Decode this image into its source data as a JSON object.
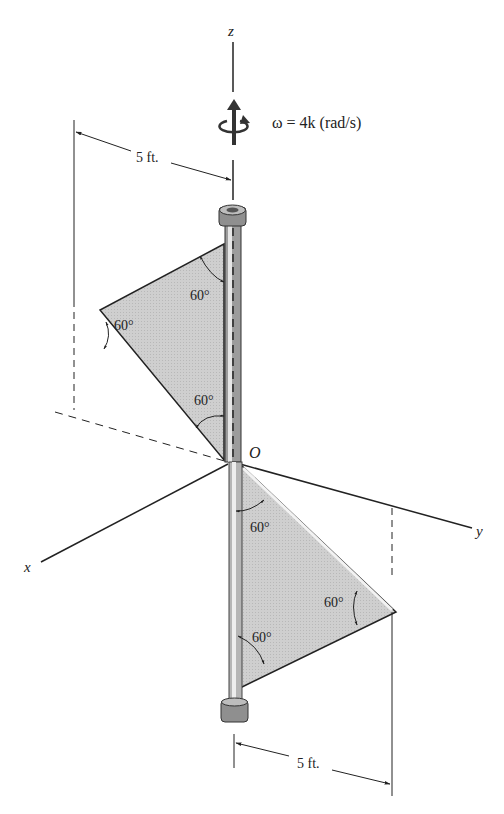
{
  "figure": {
    "type": "engineering-dynamics-diagram",
    "axes": {
      "z": "z",
      "y": "y",
      "x": "x",
      "origin": "O"
    },
    "angular_velocity": "ω = 4k (rad/s)",
    "dimensions": {
      "top": "5 ft.",
      "bottom": "5 ft."
    },
    "angles": {
      "upper_plate_top": "60°",
      "upper_plate_tip": "60°",
      "upper_plate_bottom": "60°",
      "lower_plate_top": "60°",
      "lower_plate_tip": "60°",
      "lower_plate_bottom": "60°"
    },
    "colors": {
      "plate_fill": "#c8c8c8",
      "rod": "#9a9a9a",
      "line": "#222222"
    }
  }
}
